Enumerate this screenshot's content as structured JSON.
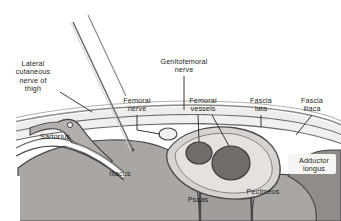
{
  "figure": {
    "title_clipped": "Lateral cutaneous nerve",
    "background_color": "#ffffff",
    "ink_color": "#231f20"
  },
  "palette": {
    "skin_light": "#e9e7e6",
    "fat_layer": "#f2f0ef",
    "fascia_line": "#6e6a68",
    "muscle_gray": "#a9a6a3",
    "muscle_dark": "#8a8784",
    "vessel_dark": "#6f6c6a",
    "sheath_light": "#d6d3d1",
    "needle_gray": "#8d8a88",
    "outline_dark": "#4a4746"
  },
  "labels": [
    {
      "id": "lateral-cutaneous-nerve-of-thigh",
      "text": "Lateral\ncutaneous\nnerve of\nthigh",
      "x": 6,
      "y": 60,
      "width": 54
    },
    {
      "id": "genitofemoral-nerve",
      "text": "Genitofemoral\nnerve",
      "x": 148,
      "y": 58,
      "width": 72
    },
    {
      "id": "femoral-nerve",
      "text": "Femoral\nnerve",
      "x": 114,
      "y": 97,
      "width": 46
    },
    {
      "id": "femoral-vessels",
      "text": "Femoral\nvessels",
      "x": 180,
      "y": 97,
      "width": 46
    },
    {
      "id": "fascia-lata",
      "text": "Fascia\nlata",
      "x": 241,
      "y": 97,
      "width": 40
    },
    {
      "id": "fascia-iliaca",
      "text": "Fascia\niliaca",
      "x": 292,
      "y": 97,
      "width": 40
    },
    {
      "id": "sartorius",
      "text": "Sartorius",
      "x": 33,
      "y": 133,
      "width": 44
    },
    {
      "id": "iliacus",
      "text": "Iliacus",
      "x": 103,
      "y": 170,
      "width": 34
    },
    {
      "id": "psoas",
      "text": "Psoas",
      "x": 182,
      "y": 196,
      "width": 32
    },
    {
      "id": "pectineus",
      "text": "Pectineus",
      "x": 240,
      "y": 188,
      "width": 46
    },
    {
      "id": "adductor-longus",
      "text": "Adductor\nlongus",
      "x": 291,
      "y": 157,
      "width": 46
    }
  ],
  "structures": [
    {
      "id": "needle",
      "name": "block-needle"
    },
    {
      "id": "skin",
      "name": "skin-surface"
    },
    {
      "id": "fascia-lata-layer",
      "name": "fascia-lata-layer"
    },
    {
      "id": "fascia-iliaca-layer",
      "name": "fascia-iliaca-layer"
    },
    {
      "id": "sartorius-muscle",
      "name": "sartorius-muscle"
    },
    {
      "id": "iliacus-muscle",
      "name": "iliacus-muscle"
    },
    {
      "id": "psoas-muscle",
      "name": "psoas-muscle"
    },
    {
      "id": "pectineus-muscle",
      "name": "pectineus-muscle"
    },
    {
      "id": "adductor-longus-muscle",
      "name": "adductor-longus-muscle"
    },
    {
      "id": "femoral-artery",
      "name": "femoral-artery-vessel"
    },
    {
      "id": "femoral-vein",
      "name": "femoral-vein-vessel"
    },
    {
      "id": "femoral-nerve-bundle",
      "name": "femoral-nerve-bundle"
    }
  ]
}
